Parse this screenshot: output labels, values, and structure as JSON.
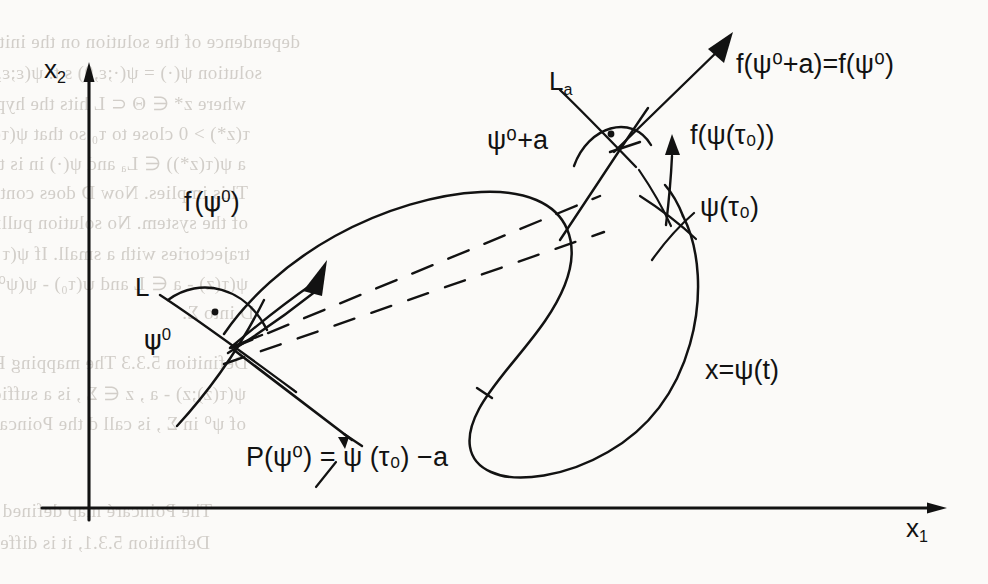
{
  "figure": {
    "kind": "hand-drawn mathematical diagram",
    "background_color": "#fbfaf8",
    "ink_color": "#121212"
  },
  "axes": {
    "vertical": {
      "label": "x",
      "subscript": "2",
      "name": "x2-axis"
    },
    "horizontal": {
      "label": "x",
      "subscript": "1",
      "name": "x1-axis"
    }
  },
  "labels": {
    "f_psi0": {
      "fn": "f",
      "open": "(",
      "psi": "ψ",
      "sup": "0",
      "close": ")"
    },
    "f_psi0_plus_a": {
      "text": "f(ψ⁰+a)=f(ψ⁰)"
    },
    "f_psi_tau0": {
      "text": "f(ψ(τ₀))"
    },
    "psi_tau0": {
      "text": "ψ(τ₀)"
    },
    "psi0": {
      "base": "ψ",
      "sup": "0"
    },
    "psi0_plus_a": {
      "text": "ψ⁰+a"
    },
    "L": {
      "text": "L"
    },
    "La": {
      "base": "L",
      "sub": "a"
    },
    "trajectory": {
      "text": "x=ψ(t)"
    },
    "poincare": {
      "text": "P(ψ⁰) = ψ (τ₀) −a"
    }
  },
  "bleed_text": [
    {
      "text": "dependence of the solution on the initial p ≠ ψ⁰ has a",
      "x": 300,
      "y": 30
    },
    {
      "text": "solution ψ(·) = ψ(·;ε,θ) s.t. ψ(ε;ε,θ) intersects",
      "x": 262,
      "y": 62
    },
    {
      "text": "where z* ∈ Θ ⊂ L hits the hyperplane L, transversally at some moment",
      "x": 246,
      "y": 92
    },
    {
      "text": "τ(z*) > 0 close to τ₀ so that ψ(τ(z*);z*) ∈ Θ and",
      "x": 250,
      "y": 122
    },
    {
      "text": "a  ψ(τ(z*)) ∈ Lₐ and ψ(·) in is the tangent to f(ψ⁰)",
      "x": 246,
      "y": 152
    },
    {
      "text": "This implies. Now D does contain any equilibrium point",
      "x": 248,
      "y": 182
    },
    {
      "text": "of the system. No solution pulling into the neighborhood of the",
      "x": 248,
      "y": 212
    },
    {
      "text": "trajectories with a small. If ψ(τ - z) ∈ L and ψ⁰ ∈ Lₐ , then exists",
      "x": 250,
      "y": 242
    },
    {
      "text": "ψ(τ(z) - a ∈ L and ψ(τ₀) - ψ(ψ⁰) - a ∈ L . This maps is the Poincare map of",
      "x": 248,
      "y": 272
    },
    {
      "text": "D into Σ.",
      "x": 254,
      "y": 302
    },
    {
      "text": "Definition 5.3.3  The mapping P : Σ → Σ defined by P(z) =",
      "x": 248,
      "y": 352
    },
    {
      "text": "ψ(τ(z);z) - a , z ∈ Σ , is a sufficiently small neighbourhood",
      "x": 246,
      "y": 382
    },
    {
      "text": "of ψ⁰ in Σ , is call d the Poincare map. (see Figure 5.3.2)",
      "x": 246,
      "y": 412
    },
    {
      "text": "The Poincaré map defined this way has analogous properties to that of",
      "x": 212,
      "y": 500
    },
    {
      "text": "Definition 5.3.1, it is diffeomorphism, and it is related to the existence of",
      "x": 210,
      "y": 532
    }
  ]
}
